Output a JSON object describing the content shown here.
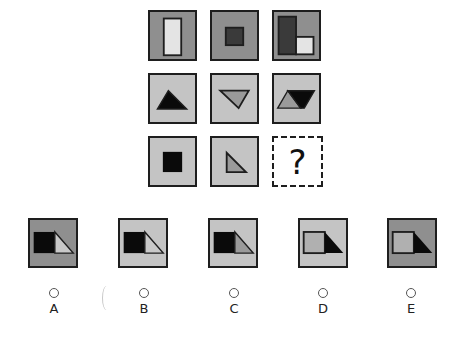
{
  "puzzle": {
    "question_mark": "?",
    "colors": {
      "dark_gray_bg": "#8f8f8f",
      "light_gray_bg": "#c4c4c4",
      "black": "#0a0a0a",
      "dark_fill": "#3a3a3a",
      "mid_fill": "#9a9a9a",
      "white_fill": "#e6e6e6",
      "border": "#1e1e1e"
    },
    "grid": [
      [
        {
          "bg": "dark",
          "shape": "tall-white-rectangle"
        },
        {
          "bg": "dark",
          "shape": "small-dark-square"
        },
        {
          "bg": "dark",
          "shape": "dark-tall-rect-plus-white-square"
        }
      ],
      [
        {
          "bg": "light",
          "shape": "black-triangle-up"
        },
        {
          "bg": "light",
          "shape": "gray-triangle-down"
        },
        {
          "bg": "light",
          "shape": "gray-and-black-parallelogram"
        }
      ],
      [
        {
          "bg": "light",
          "shape": "black-square"
        },
        {
          "bg": "light",
          "shape": "gray-right-triangle"
        },
        {
          "bg": "none",
          "shape": "question-mark"
        }
      ]
    ]
  },
  "options": [
    {
      "label": "A",
      "bg": "dark",
      "square": "black",
      "triangle": "light"
    },
    {
      "label": "B",
      "bg": "light",
      "square": "black",
      "triangle": "light"
    },
    {
      "label": "C",
      "bg": "light",
      "square": "black",
      "triangle": "gray"
    },
    {
      "label": "D",
      "bg": "light",
      "square": "gray",
      "triangle": "black"
    },
    {
      "label": "E",
      "bg": "dark",
      "square": "gray",
      "triangle": "black"
    }
  ]
}
